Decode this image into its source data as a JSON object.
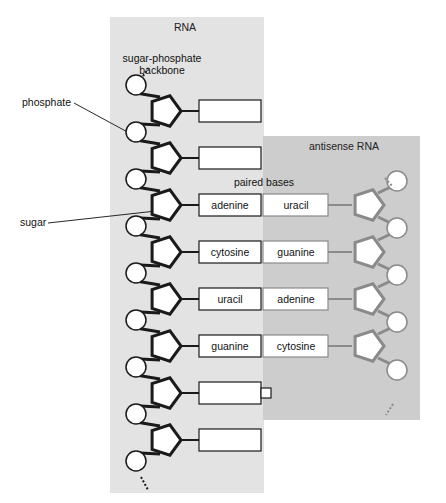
{
  "diagram": {
    "rna_panel_title": "RNA",
    "antisense_panel_title": "antisense RNA",
    "labels": {
      "backbone_line1": "sugar-phosphate",
      "backbone_line2": "backbone",
      "phosphate": "phosphate",
      "sugar": "sugar",
      "paired_bases": "paired bases"
    },
    "rna_bases": [
      "",
      "",
      "adenine",
      "cytosine",
      "uracil",
      "guanine",
      "",
      ""
    ],
    "antisense_bases": [
      "",
      "",
      "uracil",
      "guanine",
      "adenine",
      "cytosine",
      "",
      ""
    ],
    "colors": {
      "rna_panel": "#e3e3e3",
      "antisense_panel": "#cdcdcd",
      "rna_stroke": "#1a1a1a",
      "antisense_stroke": "#8a8a8a",
      "base_fill": "#ffffff"
    }
  }
}
